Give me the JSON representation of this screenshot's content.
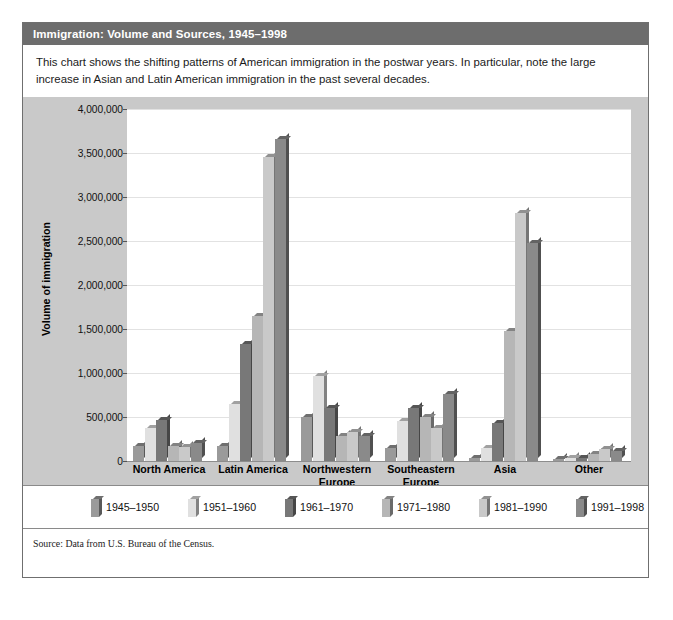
{
  "figure": {
    "title": "Immigration: Volume and Sources, 1945–1998",
    "caption": "This chart shows the shifting patterns of American immigration in the postwar years. In particular, note the large increase in Asian and Latin American immigration in the past several decades.",
    "source": "Source: Data from U.S. Bureau of the Census."
  },
  "chart_data": {
    "type": "bar",
    "title": "Immigration: Volume and Sources, 1945–1998",
    "xlabel": "",
    "ylabel": "Volume of immigration",
    "ylim": [
      0,
      4000000
    ],
    "ytick_labels": [
      "4,000,000",
      "3,500,000",
      "3,000,000",
      "2,500,000",
      "2,000,000",
      "1,500,000",
      "1,000,000",
      "500,000",
      "0"
    ],
    "ytick_values": [
      4000000,
      3500000,
      3000000,
      2500000,
      2000000,
      1500000,
      1000000,
      500000,
      0
    ],
    "grid": true,
    "legend_position": "bottom",
    "categories": [
      "North America",
      "Latin America",
      "Northwestern Europe",
      "Southeastern Europe",
      "Asia",
      "Other"
    ],
    "series": [
      {
        "name": "1945–1950",
        "color": "#9a9a9a",
        "values": [
          170000,
          170000,
          500000,
          150000,
          35000,
          25000
        ]
      },
      {
        "name": "1951–1960",
        "color": "#e0e0e0",
        "values": [
          380000,
          650000,
          970000,
          450000,
          150000,
          30000
        ]
      },
      {
        "name": "1961–1970",
        "color": "#787878",
        "values": [
          470000,
          1330000,
          600000,
          600000,
          430000,
          40000
        ]
      },
      {
        "name": "1971–1980",
        "color": "#b6b6b6",
        "values": [
          170000,
          1650000,
          290000,
          500000,
          1480000,
          85000
        ]
      },
      {
        "name": "1981–1990",
        "color": "#c9c9c9",
        "values": [
          160000,
          3460000,
          330000,
          380000,
          2820000,
          140000
        ]
      },
      {
        "name": "1991–1998",
        "color": "#8a8a8a",
        "values": [
          200000,
          3660000,
          280000,
          760000,
          2480000,
          115000
        ]
      }
    ]
  },
  "colors": {
    "panel_background": "#c9c9c9",
    "plot_background": "#ffffff",
    "title_bar": "#6d6d6d",
    "gridline": "#e2e2e2",
    "axis": "#8d8d8d"
  }
}
